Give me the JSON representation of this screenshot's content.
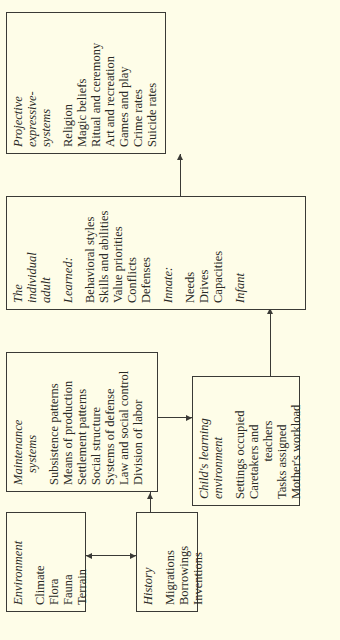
{
  "diagram": {
    "environment": {
      "title": "Environment",
      "items": [
        "Climate",
        "Flora",
        "Fauna",
        "Terrain"
      ]
    },
    "history": {
      "title": "History",
      "items": [
        "Migrations",
        "Borrowings",
        "Inventions"
      ]
    },
    "maintenance": {
      "title_1": "Maintenance",
      "title_2": "systems",
      "items": [
        "Subsistence patterns",
        "Means of production",
        "Settlement patterns",
        "Social structure",
        "Systems of defense",
        "Law and social control",
        "Division of labor"
      ]
    },
    "child": {
      "title_1": "Child's learning",
      "title_2": "environment",
      "items": [
        "Settings occupied",
        "Caretakers and",
        "teachers",
        "Tasks assigned",
        "Mother's workload"
      ]
    },
    "adult": {
      "title_1": "The",
      "title_2": "individual",
      "title_3": "adult",
      "learned_label": "Learned:",
      "learned": [
        "Behavioral styles",
        "Skills and abilities",
        "Value priorities",
        "Conflicts",
        "Defenses"
      ],
      "innate_label": "Innate:",
      "innate": [
        "Needs",
        "Drives",
        "Capacities"
      ],
      "infant_label": "Infant"
    },
    "projective": {
      "title_1": "Projective",
      "title_2": "expressive-",
      "title_3": "systems",
      "items": [
        "Religion",
        "Magic beliefs",
        "Ritual and ceremony",
        "Art and recreation",
        "Games and play",
        "Crime rates",
        "Suicide rates"
      ]
    }
  }
}
